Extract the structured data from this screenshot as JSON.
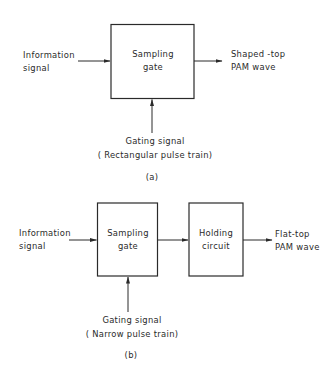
{
  "diagram_a": {
    "caption": "(a)",
    "input": {
      "line1": "Information",
      "line2": "signal"
    },
    "block": {
      "line1": "Sampling",
      "line2": "gate"
    },
    "output": {
      "line1": "Shaped -top",
      "line2": "PAM wave"
    },
    "control": {
      "line1": "Gating signal",
      "line2": "( Rectangular pulse train)"
    }
  },
  "diagram_b": {
    "caption": "(b)",
    "input": {
      "line1": "Information",
      "line2": "signal"
    },
    "block1": {
      "line1": "Sampling",
      "line2": "gate"
    },
    "block2": {
      "line1": "Holding",
      "line2": "circuit"
    },
    "output": {
      "line1": "Flat-top",
      "line2": "PAM wave"
    },
    "control": {
      "line1": "Gating signal",
      "line2": "( Narrow pulse train)"
    }
  },
  "colors": {
    "line": "#2a2a2a",
    "background": "#ffffff"
  }
}
